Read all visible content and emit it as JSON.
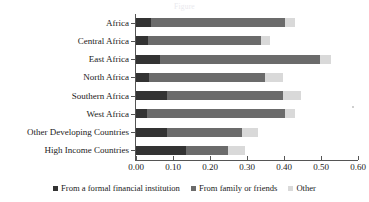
{
  "chart_data": {
    "type": "bar",
    "orientation": "horizontal",
    "stacked": true,
    "title": "",
    "xlabel": "",
    "ylabel": "",
    "xlim": [
      0.0,
      0.6
    ],
    "xticks": [
      "0.00",
      "0.10",
      "0.20",
      "0.30",
      "0.40",
      "0.50",
      "0.60"
    ],
    "xtick_values": [
      0.0,
      0.1,
      0.2,
      0.3,
      0.4,
      0.5,
      0.6
    ],
    "grid": false,
    "legend_position": "bottom",
    "categories": [
      "Africa",
      "Central Africa",
      "East Africa",
      "North Africa",
      "Southern Africa",
      "West Africa",
      "Other Developing Countries",
      "High Income Countries"
    ],
    "series": [
      {
        "name": "From a formal financial institution",
        "color": "#333333",
        "values": [
          0.041,
          0.032,
          0.065,
          0.035,
          0.084,
          0.03,
          0.084,
          0.135
        ]
      },
      {
        "name": "From family or friends",
        "color": "#6b6b6b",
        "values": [
          0.362,
          0.306,
          0.432,
          0.314,
          0.313,
          0.373,
          0.202,
          0.114
        ]
      },
      {
        "name": "Other",
        "color": "#d9d9d9",
        "values": [
          0.027,
          0.024,
          0.03,
          0.048,
          0.049,
          0.027,
          0.044,
          0.046
        ]
      }
    ],
    "totals": [
      0.43,
      0.362,
      0.527,
      0.397,
      0.446,
      0.43,
      0.33,
      0.295
    ]
  },
  "legend": {
    "items": [
      {
        "label": "From a formal financial institution",
        "color": "#333333"
      },
      {
        "label": "From family or friends",
        "color": "#6b6b6b"
      },
      {
        "label": "Other",
        "color": "#d9d9d9"
      }
    ]
  },
  "cut_off_title": "Figure"
}
